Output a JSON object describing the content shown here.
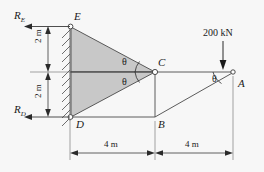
{
  "diagram": {
    "background_color": "#f7f7f7",
    "member_fill_color": "#c8c8c8",
    "line_color": "#3a3a3a",
    "reactions": {
      "top_label_main": "R",
      "top_label_sub": "E",
      "bottom_label_main": "R",
      "bottom_label_sub": "D"
    },
    "joints": {
      "e": "E",
      "c": "C",
      "d": "D",
      "b": "B",
      "a": "A"
    },
    "load": {
      "value": "200 kN",
      "direction": "down"
    },
    "angles": {
      "upper_c": "θ",
      "lower_c": "θ",
      "at_a": "θ"
    },
    "dimensions": {
      "vertical_top": "2 m",
      "vertical_bottom": "2 m",
      "horizontal_left": "4 m",
      "horizontal_right": "4 m"
    }
  }
}
